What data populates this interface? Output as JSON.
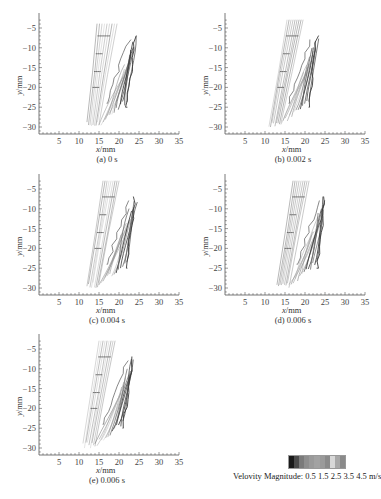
{
  "chart_data": [
    {
      "type": "streamline",
      "title": "(a) 0 s",
      "xlabel": "x/mm",
      "ylabel": "y/mm",
      "xlim": [
        0,
        35
      ],
      "ylim": [
        -32,
        -2
      ],
      "xticks": [
        5,
        10,
        15,
        20,
        25,
        30,
        35
      ],
      "yticks": [
        -5,
        -10,
        -15,
        -20,
        -25,
        -30
      ],
      "grid": false,
      "jet_left": {
        "x_top": [
          14.5,
          19.5
        ],
        "x_bottom": [
          12,
          15
        ],
        "y_range": [
          -30,
          -4
        ]
      },
      "jet_right": {
        "tip": [
          24,
          -7
        ],
        "base_x": [
          15,
          22
        ],
        "y_range": [
          -30,
          -7
        ]
      }
    },
    {
      "type": "streamline",
      "title": "(b) 0.002 s",
      "xlabel": "x/mm",
      "ylabel": "y/mm",
      "xlim": [
        0,
        35
      ],
      "ylim": [
        -32,
        -2
      ],
      "xticks": [
        5,
        10,
        15,
        20,
        25,
        30,
        35
      ],
      "yticks": [
        -5,
        -10,
        -15,
        -20,
        -25,
        -30
      ],
      "grid": false,
      "jet_left": {
        "x_top": [
          15.5,
          19.5
        ],
        "x_bottom": [
          11,
          14
        ],
        "y_range": [
          -30,
          -3
        ]
      },
      "jet_right": {
        "tip": [
          23,
          -7
        ],
        "base_x": [
          14,
          21
        ],
        "y_range": [
          -30,
          -7
        ]
      }
    },
    {
      "type": "streamline",
      "title": "(c) 0.004 s",
      "xlabel": "x/mm",
      "ylabel": "y/mm",
      "xlim": [
        0,
        35
      ],
      "ylim": [
        -32,
        -2
      ],
      "xticks": [
        5,
        10,
        15,
        20,
        25,
        30,
        35
      ],
      "yticks": [
        -5,
        -10,
        -15,
        -20,
        -25,
        -30
      ],
      "grid": false,
      "jet_left": {
        "x_top": [
          16,
          20
        ],
        "x_bottom": [
          12,
          15
        ],
        "y_range": [
          -30,
          -3
        ]
      },
      "jet_right": {
        "tip": [
          24,
          -7
        ],
        "base_x": [
          15,
          22
        ],
        "y_range": [
          -30,
          -7
        ]
      }
    },
    {
      "type": "streamline",
      "title": "(d) 0.006 s",
      "xlabel": "x/mm",
      "ylabel": "y/mm",
      "xlim": [
        0,
        35
      ],
      "ylim": [
        -32,
        -2
      ],
      "xticks": [
        5,
        10,
        15,
        20,
        25,
        30,
        35
      ],
      "yticks": [
        -5,
        -10,
        -15,
        -20,
        -25,
        -30
      ],
      "grid": false,
      "jet_left": {
        "x_top": [
          17,
          21
        ],
        "x_bottom": [
          13,
          16
        ],
        "y_range": [
          -30,
          -3
        ]
      },
      "jet_right": {
        "tip": [
          25,
          -7
        ],
        "base_x": [
          16,
          23
        ],
        "y_range": [
          -30,
          -7
        ]
      }
    },
    {
      "type": "streamline",
      "title": "(e) 0.006 s",
      "xlabel": "x/mm",
      "ylabel": "y/mm",
      "xlim": [
        0,
        35
      ],
      "ylim": [
        -32,
        -2
      ],
      "xticks": [
        5,
        10,
        15,
        20,
        25,
        30,
        35
      ],
      "yticks": [
        -5,
        -10,
        -15,
        -20,
        -25,
        -30
      ],
      "grid": false,
      "jet_left": {
        "x_top": [
          15,
          19
        ],
        "x_bottom": [
          11,
          14
        ],
        "y_range": [
          -30,
          -3
        ]
      },
      "jet_right": {
        "tip": [
          23.5,
          -7
        ],
        "base_x": [
          14,
          21
        ],
        "y_range": [
          -30,
          -7
        ]
      }
    }
  ],
  "panels": [
    {
      "caption": "(a) 0 s",
      "xlabel_var": "x",
      "xlabel_unit": "/mm",
      "ylabel": "y/mm"
    },
    {
      "caption": "(b) 0.002 s",
      "xlabel_var": "x",
      "xlabel_unit": "/mm",
      "ylabel": "y/mm"
    },
    {
      "caption": "(c) 0.004 s",
      "xlabel_var": "x",
      "xlabel_unit": "/mm",
      "ylabel": "y/mm"
    },
    {
      "caption": "(d) 0.006 s",
      "xlabel_var": "x",
      "xlabel_unit": "/mm",
      "ylabel": "y/mm"
    },
    {
      "caption": "(e) 0.006 s",
      "xlabel_var": "x",
      "xlabel_unit": "/mm",
      "ylabel": "y/mm"
    }
  ],
  "legend": {
    "label": "Velovity Magnitude: 0.5 1.5 2.5 3.5 4.5 m/s",
    "colorbar": [
      "#1a1a1a",
      "#4a4a4a",
      "#7a7a7a",
      "#8e8e8e",
      "#9a9a9a",
      "#a2a2a2",
      "#9a9a9a",
      "#8a8a8a",
      "#d8d8d8",
      "#a8a8a8",
      "#8a8a8a"
    ]
  }
}
